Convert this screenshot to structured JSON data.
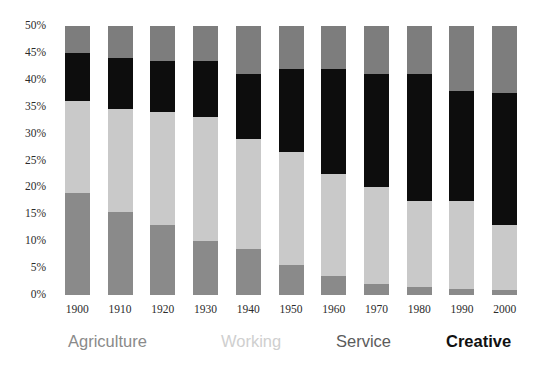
{
  "chart_data": {
    "type": "bar",
    "stacked": true,
    "title": "",
    "subtitle": "",
    "xlabel": "",
    "ylabel": "",
    "grid": false,
    "legend_position": "bottom",
    "ylim": [
      0,
      50
    ],
    "yticks": [
      "0%",
      "5%",
      "10%",
      "15%",
      "20%",
      "25%",
      "30%",
      "35%",
      "40%",
      "45%",
      "50%"
    ],
    "ytick_values": [
      0,
      5,
      10,
      15,
      20,
      25,
      30,
      35,
      40,
      45,
      50
    ],
    "categories": [
      "1900",
      "1910",
      "1920",
      "1930",
      "1940",
      "1950",
      "1960",
      "1970",
      "1980",
      "1990",
      "2000"
    ],
    "series": [
      {
        "name": "Agriculture",
        "color": "#8a8a8a",
        "values": [
          19.0,
          15.5,
          13.0,
          10.0,
          8.5,
          5.5,
          3.5,
          2.0,
          1.5,
          1.2,
          1.0
        ]
      },
      {
        "name": "Working",
        "color": "#c9c9c9",
        "values": [
          17.0,
          19.0,
          21.0,
          23.0,
          20.5,
          21.0,
          19.0,
          18.0,
          16.0,
          16.3,
          12.0
        ]
      },
      {
        "name": "Creative",
        "color": "#0d0d0d",
        "values": [
          9.0,
          9.5,
          9.5,
          10.5,
          12.0,
          15.5,
          19.5,
          21.0,
          23.5,
          20.5,
          24.5
        ]
      },
      {
        "name": "Service",
        "color": "#7d7d7d",
        "values": [
          5.0,
          6.0,
          6.5,
          6.5,
          9.0,
          8.0,
          8.0,
          9.0,
          9.0,
          12.0,
          12.5
        ]
      }
    ],
    "stack_order_bottom_to_top": [
      "Agriculture",
      "Working",
      "Creative",
      "Service"
    ],
    "legend": [
      {
        "label": "Agriculture",
        "color": "#8a8a8a",
        "weight": "normal"
      },
      {
        "label": "Working",
        "color": "#cfcfcf",
        "weight": "normal"
      },
      {
        "label": "Service",
        "color": "#5b5b5b",
        "weight": "normal"
      },
      {
        "label": "Creative",
        "color": "#111111",
        "weight": "bold"
      }
    ]
  },
  "colors": {
    "agriculture": "#8a8a8a",
    "working": "#c9c9c9",
    "service": "#7d7d7d",
    "creative": "#0d0d0d",
    "background": "#ffffff",
    "tick_text": "#2b2b2b"
  }
}
